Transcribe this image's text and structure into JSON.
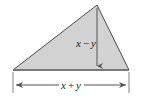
{
  "figure": {
    "name": "shaded-triangle-with-dimensions",
    "background_color": "#ffffff",
    "shape": {
      "type": "triangle",
      "fill_color": "#d2d2d2",
      "stroke_color": "#4a4a4a",
      "stroke_width": 1,
      "vertices": {
        "apex": {
          "x": 97,
          "y": 5
        },
        "bottom_left": {
          "x": 13,
          "y": 70
        },
        "bottom_right": {
          "x": 129,
          "y": 70
        }
      }
    },
    "height_annotation": {
      "label_text": "x − y",
      "label_parts": {
        "left_var": "x",
        "operator": "−",
        "right_var": "y"
      },
      "line_color": "#555555",
      "arrow_direction": "down",
      "from": {
        "x": 97,
        "y": 8
      },
      "to": {
        "x": 97,
        "y": 70
      },
      "label_position": {
        "x": 86,
        "y": 46
      }
    },
    "base_annotation": {
      "label_text": "x + y",
      "label_parts": {
        "left_var": "x",
        "operator": "+",
        "right_var": "y"
      },
      "line_color": "#555555",
      "arrow_direction": "both",
      "from": {
        "x": 13,
        "y": 85
      },
      "to": {
        "x": 129,
        "y": 85
      },
      "label_position": {
        "x": 71,
        "y": 88
      },
      "extension_lines": [
        {
          "x": 13,
          "y1": 72,
          "y2": 93
        },
        {
          "x": 129,
          "y1": 72,
          "y2": 93
        }
      ]
    }
  }
}
